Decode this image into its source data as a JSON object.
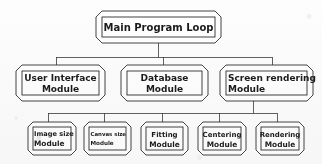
{
  "diagram": {
    "title": "Main Program Loop",
    "type": "hierarchical block diagram",
    "ink_color": "#2a2a2a",
    "box_fill": "#ffffff",
    "background_color": "#fdfdfd",
    "text_color": "#1b1b1b",
    "levels": [
      {
        "level": 1,
        "nodes": [
          {
            "id": "main-program-loop",
            "line1": "Main Program Loop",
            "line2": ""
          }
        ]
      },
      {
        "level": 2,
        "nodes": [
          {
            "id": "user-interface-module",
            "line1": "User Interface",
            "line2": "Module"
          },
          {
            "id": "database-module",
            "line1": "Database",
            "line2": "Module"
          },
          {
            "id": "screen-rendering-module",
            "line1": "Screen rendering",
            "line2": "Module"
          }
        ]
      },
      {
        "level": 3,
        "nodes": [
          {
            "id": "image-size-module",
            "line1": "Image size",
            "line2": "Module"
          },
          {
            "id": "canvas-size-module",
            "line1": "Canvas size",
            "line2": "Module"
          },
          {
            "id": "fitting-module",
            "line1": "Fitting",
            "line2": "Module"
          },
          {
            "id": "centering-module",
            "line1": "Centering",
            "line2": "Module"
          },
          {
            "id": "rendering-module",
            "line1": "Rendering",
            "line2": "Module"
          }
        ]
      }
    ],
    "edges": [
      {
        "from": "main-program-loop",
        "to": "user-interface-module"
      },
      {
        "from": "main-program-loop",
        "to": "database-module"
      },
      {
        "from": "main-program-loop",
        "to": "screen-rendering-module"
      },
      {
        "from": "screen-rendering-module",
        "to": "image-size-module"
      },
      {
        "from": "screen-rendering-module",
        "to": "canvas-size-module"
      },
      {
        "from": "screen-rendering-module",
        "to": "fitting-module"
      },
      {
        "from": "screen-rendering-module",
        "to": "centering-module"
      },
      {
        "from": "screen-rendering-module",
        "to": "rendering-module"
      }
    ]
  }
}
